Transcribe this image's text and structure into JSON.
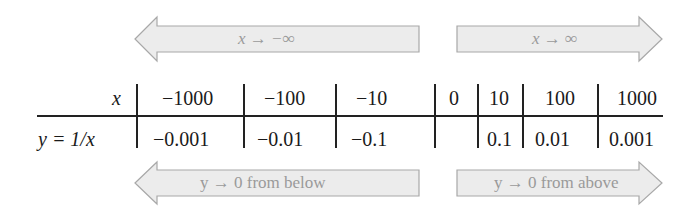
{
  "arrows": {
    "top_left": {
      "label": "x → −∞",
      "direction": "left"
    },
    "top_right": {
      "label": "x → ∞",
      "direction": "right"
    },
    "bottom_left": {
      "label": "y → 0 from below",
      "direction": "left"
    },
    "bottom_right": {
      "label": "y → 0 from above",
      "direction": "right"
    }
  },
  "table": {
    "row_headers": {
      "x": "x",
      "y": "y = 1/x"
    },
    "x_values": [
      "−1000",
      "−100",
      "−10",
      "0",
      "10",
      "100",
      "1000"
    ],
    "y_values": [
      "−0.001",
      "−0.01",
      "−0.1",
      "",
      "0.1",
      "0.01",
      "0.001"
    ]
  },
  "colors": {
    "arrow_fill": "#ececec",
    "arrow_stroke": "#a8a8a8",
    "arrow_text": "#9a9a9a",
    "table_text": "#1a1a1a",
    "rule": "#222222"
  }
}
